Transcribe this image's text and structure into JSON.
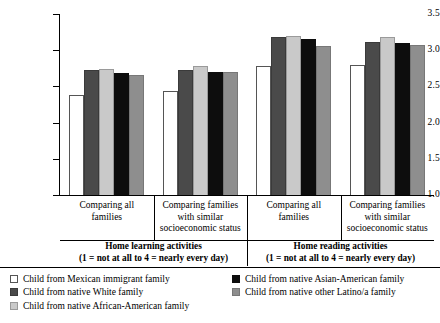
{
  "chart_data": {
    "type": "bar",
    "title": "",
    "xlabel": "",
    "ylabel": "",
    "ylim": [
      1.0,
      3.5
    ],
    "ytick_labels": [
      "1.0",
      "1.5",
      "2.0",
      "2.5",
      "3.0",
      "3.5"
    ],
    "ytick_values": [
      1.0,
      1.5,
      2.0,
      2.5,
      3.0,
      3.5
    ],
    "grid": false,
    "legend_position": "bottom",
    "categories": [
      "Comparing all families",
      "Comparing families with similar socioeconomic status",
      "Comparing all families",
      "Comparing families with similar socioeconomic status"
    ],
    "series": [
      {
        "name": "Child from Mexican immigrant family",
        "color": "#ffffff",
        "values": [
          2.39,
          2.45,
          2.8,
          2.81
        ]
      },
      {
        "name": "Child from native White family",
        "color": "#4a4a4a",
        "values": [
          2.74,
          2.74,
          3.19,
          3.13
        ]
      },
      {
        "name": "Child from native African-American family",
        "color": "#c9c9c9",
        "values": [
          2.76,
          2.8,
          3.21,
          3.2
        ]
      },
      {
        "name": "Child from native Asian-American family",
        "color": "#0d0d0d",
        "values": [
          2.7,
          2.71,
          3.17,
          3.12
        ]
      },
      {
        "name": "Child from native other Latino/a family",
        "color": "#8e8e8e",
        "values": [
          2.67,
          2.71,
          3.07,
          3.08
        ]
      }
    ],
    "sections": [
      {
        "title": "Home learning activities",
        "scale_note": "(1 = not at all to 4 = nearly every day)"
      },
      {
        "title": "Home reading activities",
        "scale_note": "(1 = not at all to 4 = nearly every day)"
      }
    ]
  },
  "axis": {
    "ticks": [
      {
        "label": "3.5"
      },
      {
        "label": "3.0"
      },
      {
        "label": "2.5"
      },
      {
        "label": "2.0"
      },
      {
        "label": "1.5"
      },
      {
        "label": "1.0"
      }
    ]
  },
  "categories": [
    {
      "line1": "Comparing all",
      "line2": "families",
      "line3": ""
    },
    {
      "line1": "Comparing families",
      "line2": "with similar",
      "line3": "socioeconomic status"
    },
    {
      "line1": "Comparing all",
      "line2": "families",
      "line3": ""
    },
    {
      "line1": "Comparing families",
      "line2": "with similar",
      "line3": "socioeconomic status"
    }
  ],
  "sections": [
    {
      "title": "Home learning activities",
      "note": "(1 = not at all to 4 = nearly every day)"
    },
    {
      "title": "Home reading activities",
      "note": "(1 = not at all to 4 = nearly every day)"
    }
  ],
  "legend": {
    "left": [
      {
        "label": "Child from Mexican immigrant family",
        "swatch": "white"
      },
      {
        "label": "Child from native White family",
        "swatch": "darkgray"
      },
      {
        "label": "Child from native African-American family",
        "swatch": "lightgray"
      }
    ],
    "right": [
      {
        "label": "Child from native Asian-American family",
        "swatch": "black"
      },
      {
        "label": "Child from native other Latino/a family",
        "swatch": "medgray"
      }
    ]
  }
}
